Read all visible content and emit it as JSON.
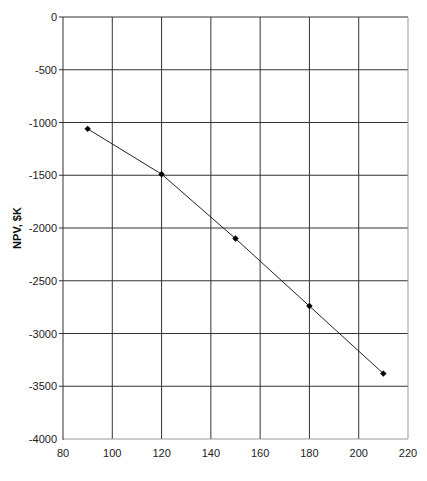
{
  "chart_data": {
    "type": "line",
    "title": "",
    "xlabel": "",
    "ylabel": "NPV, $K",
    "xlim": [
      80,
      220
    ],
    "ylim": [
      -4000,
      0
    ],
    "xticks": [
      80,
      100,
      120,
      140,
      160,
      180,
      200,
      220
    ],
    "yticks": [
      0,
      -500,
      -1000,
      -1500,
      -2000,
      -2500,
      -3000,
      -3500,
      -4000
    ],
    "xtick_labels": [
      "80",
      "100",
      "120",
      "140",
      "160",
      "180",
      "200",
      "220"
    ],
    "ytick_labels": [
      "0",
      "-500",
      "-1000",
      "-1500",
      "-2000",
      "-2500",
      "-3000",
      "-3500",
      "-4000"
    ],
    "grid": true,
    "legend": "none",
    "series": [
      {
        "name": "NPV",
        "x": [
          90,
          120,
          150,
          180,
          210
        ],
        "y": [
          -1060,
          -1490,
          -2100,
          -2740,
          -3380
        ],
        "marker": "diamond",
        "color": "#000000"
      }
    ]
  }
}
